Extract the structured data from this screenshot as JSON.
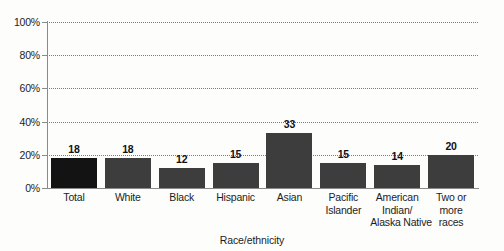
{
  "chart_data": {
    "type": "bar",
    "title": "",
    "xlabel": "Race/ethnicity",
    "ylabel": "",
    "categories": [
      "Total",
      "White",
      "Black",
      "Hispanic",
      "Asian",
      "Pacific Islander",
      "American Indian/ Alaska Native",
      "Two or more races"
    ],
    "category_lines": [
      [
        "Total"
      ],
      [
        "White"
      ],
      [
        "Black"
      ],
      [
        "Hispanic"
      ],
      [
        "Asian"
      ],
      [
        "Pacific",
        "Islander"
      ],
      [
        "American",
        "Indian/",
        "Alaska Native"
      ],
      [
        "Two or",
        "more",
        "races"
      ]
    ],
    "values": [
      18,
      18,
      12,
      15,
      33,
      15,
      14,
      20
    ],
    "value_labels": [
      "18",
      "18",
      "12",
      "15",
      "33",
      "15",
      "14",
      "20"
    ],
    "ylim": [
      0,
      100
    ],
    "ytick_values": [
      0,
      20,
      40,
      60,
      80,
      100
    ],
    "ytick_labels": [
      "0%",
      "20%",
      "40%",
      "60%",
      "80%",
      "100%"
    ],
    "grid": true,
    "grid_style": "dotted",
    "legend": "none",
    "bar_color": "#3d3d3d",
    "highlight_bar_color": "#131313",
    "highlight_index": 0,
    "axis_color": "#8a8a8a",
    "text_color": "#1c1c1c",
    "background": "#fdfdfc"
  }
}
